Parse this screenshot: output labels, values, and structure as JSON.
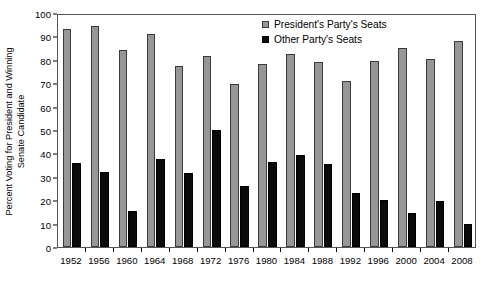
{
  "chart_data": {
    "type": "bar",
    "title": "",
    "xlabel": "",
    "ylabel": "Percent Voting for President and Winning Senate Candidate",
    "ylabel_line1": "Percent Voting for President and Winning",
    "ylabel_line2": "Senate Candidate",
    "ylim": [
      0,
      100
    ],
    "yticks": [
      0,
      10,
      20,
      30,
      40,
      50,
      60,
      70,
      80,
      90,
      100
    ],
    "grid": false,
    "legend_position": "top-right",
    "categories": [
      "1952",
      "1956",
      "1960",
      "1964",
      "1968",
      "1972",
      "1976",
      "1980",
      "1984",
      "1988",
      "1992",
      "1996",
      "2000",
      "2004",
      "2008"
    ],
    "series": [
      {
        "name": "President's Party's Seats",
        "color": "#969696",
        "values": [
          93,
          94.5,
          84,
          91,
          77.5,
          81.5,
          69.5,
          78,
          82.5,
          79,
          71,
          79.5,
          85,
          80.5,
          88
        ]
      },
      {
        "name": "Other Party's Seats",
        "color": "#0a0a0a",
        "values": [
          36,
          32,
          15.5,
          37.5,
          31.5,
          50,
          26,
          36.5,
          39.5,
          35.5,
          23,
          20,
          14.5,
          19.5,
          10
        ]
      }
    ]
  },
  "legend": {
    "items": [
      {
        "label": "President's Party's Seats",
        "marker": "gray-square"
      },
      {
        "label": "Other Party's Seats",
        "marker": "black-square"
      }
    ]
  },
  "colors": {
    "presidents_party": "#969696",
    "other_party": "#0a0a0a",
    "axis": "#000000",
    "frame": "#555555",
    "background": "#ffffff"
  }
}
